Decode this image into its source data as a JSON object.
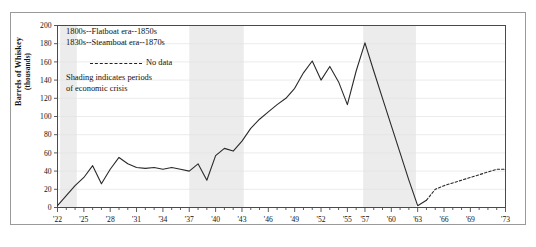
{
  "figure": {
    "background": "#ffffff",
    "frame_color": "#9a9a9a"
  },
  "legend": {
    "era_line_1": "1800s--Flatboat era--1850s",
    "era_line_2": "1830s--Steamboat era--1870s",
    "no_data_label": "No data",
    "shading_line_1": "Shading indicates periods",
    "shading_line_2": "of economic crisis"
  },
  "axes": {
    "ylabel_main": "Barrels of Whiskey",
    "ylabel_sub": "(thousands)",
    "xlabel": ""
  },
  "chart_data": {
    "type": "line",
    "title": "",
    "xlabel": "",
    "ylabel": "Barrels of Whiskey (thousands)",
    "ylim": [
      0,
      200
    ],
    "xlim": [
      1822,
      1873
    ],
    "grid": true,
    "legend_position": "upper-left",
    "ytick_values": [
      0,
      20,
      40,
      60,
      80,
      100,
      120,
      140,
      160,
      180,
      200
    ],
    "ytick_labels": [
      "0",
      "20",
      "40",
      "60",
      "80",
      "100",
      "120",
      "140",
      "160",
      "180",
      "200"
    ],
    "xtick_values": [
      1822,
      1825,
      1828,
      1831,
      1834,
      1837,
      1840,
      1843,
      1846,
      1849,
      1852,
      1855,
      1857,
      1860,
      1863,
      1866,
      1869,
      1873
    ],
    "xtick_labels": [
      "'22",
      "'25",
      "'28",
      "'31",
      "'34",
      "'37",
      "'40",
      "'43",
      "'46",
      "'49",
      "'52",
      "'55",
      "'57",
      "'60",
      "'63",
      "'66",
      "'69",
      "'73"
    ],
    "xtick_minor_step": 1,
    "series": [
      {
        "name": "Barrels of whiskey (recorded)",
        "style": "solid",
        "color": "#2a2a2a",
        "x": [
          1822,
          1823,
          1824,
          1825,
          1826,
          1827,
          1828,
          1829,
          1830,
          1831,
          1832,
          1833,
          1834,
          1835,
          1836,
          1837,
          1838,
          1839,
          1840,
          1841,
          1842,
          1843,
          1844,
          1845,
          1846,
          1847,
          1848,
          1849,
          1850,
          1851,
          1852,
          1853,
          1854,
          1855,
          1856,
          1857,
          1858,
          1859,
          1860,
          1861,
          1862,
          1863,
          1864
        ],
        "y": [
          2,
          13,
          24,
          33,
          46,
          26,
          42,
          55,
          48,
          44,
          43,
          44,
          42,
          44,
          42,
          40,
          48,
          30,
          57,
          65,
          62,
          73,
          87,
          97,
          105,
          113,
          120,
          131,
          148,
          161,
          140,
          155,
          138,
          113,
          150,
          181,
          150,
          120,
          90,
          60,
          30,
          2,
          8
        ]
      },
      {
        "name": "Barrels of whiskey (no data / estimated)",
        "style": "dashed",
        "color": "#2a2a2a",
        "x": [
          1864,
          1865,
          1866,
          1867,
          1868,
          1869,
          1870,
          1871,
          1872,
          1873
        ],
        "y": [
          8,
          20,
          24,
          27,
          30,
          33,
          36,
          39,
          42,
          42
        ]
      }
    ],
    "shaded_regions": [
      {
        "label": "economic crisis",
        "x_start": 1822.3,
        "x_end": 1824.2,
        "color": "#ececec"
      },
      {
        "label": "economic crisis",
        "x_start": 1837.0,
        "x_end": 1843.2,
        "color": "#ececec"
      },
      {
        "label": "economic crisis",
        "x_start": 1856.8,
        "x_end": 1862.8,
        "color": "#ececec"
      }
    ]
  }
}
